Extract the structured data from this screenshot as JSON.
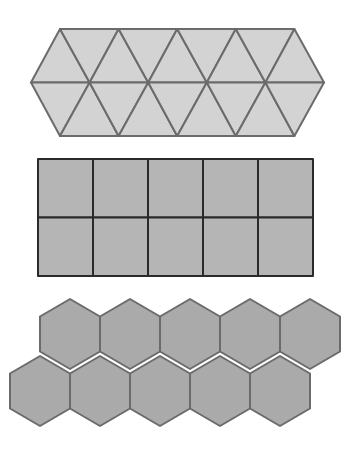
{
  "diagram": {
    "colors": {
      "background": "#ffffff",
      "triangle_fill": "#d3d3d3",
      "triangle_stroke": "#6b6b6b",
      "square_fill": "#b5b5b5",
      "square_stroke": "#2a2a2a",
      "hexagon_fill": "#aaaaaa",
      "hexagon_stroke": "#6b6b6b"
    },
    "panels": [
      {
        "name": "triangle-tiling",
        "shape": "equilateral triangle",
        "count": 16,
        "rows": 2
      },
      {
        "name": "square-tiling",
        "shape": "square",
        "count": 10,
        "rows": 2,
        "columns": 5
      },
      {
        "name": "hexagon-tiling",
        "shape": "regular hexagon",
        "count": 10,
        "rows": 2,
        "per_row": 5
      }
    ]
  }
}
